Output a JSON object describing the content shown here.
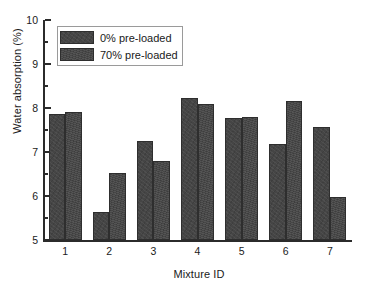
{
  "chart_data": {
    "type": "bar",
    "title": "",
    "xlabel": "Mixture ID",
    "ylabel": "Water absorption (%)",
    "categories": [
      "1",
      "2",
      "3",
      "4",
      "5",
      "6",
      "7"
    ],
    "series": [
      {
        "name": "0% pre-loaded",
        "values": [
          7.87,
          5.64,
          7.26,
          8.22,
          7.78,
          7.18,
          7.57
        ],
        "color": "#454545"
      },
      {
        "name": "70% pre-loaded",
        "values": [
          7.92,
          6.52,
          6.8,
          8.1,
          7.79,
          8.17,
          5.98
        ],
        "color": "#464646"
      }
    ],
    "ylim": [
      5,
      10
    ],
    "ytick_labels": [
      "5",
      "6",
      "7",
      "8",
      "9",
      "10"
    ],
    "ytick_values": [
      5,
      6,
      7,
      8,
      9,
      10
    ],
    "yminor_values": [
      5.5,
      6.5,
      7.5,
      8.5,
      9.5
    ],
    "grid": false,
    "legend_position": "upper-left",
    "legend_boxed": true,
    "spines": [
      "left",
      "bottom"
    ]
  }
}
